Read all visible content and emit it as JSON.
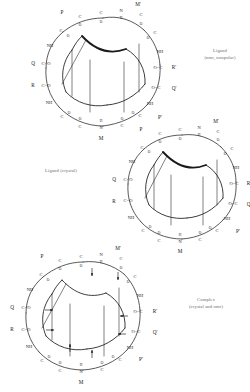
{
  "figure": {
    "background_color": "#ffffff",
    "ink_color": "#1a1a1a",
    "caption_color": "#6b6b6b",
    "width": 250,
    "height": 392
  },
  "captions": {
    "ligand_nmr": {
      "line1": "Ligand",
      "line2": "(nmr, nonpolar)"
    },
    "ligand_crystal": {
      "line1": "Ligand (crystal)",
      "line2": ""
    },
    "complex": {
      "line1": "Complex",
      "line2": "(crystal and nmr)"
    }
  },
  "panels": [
    {
      "id": "panel-a",
      "name": "ligand-nmr-nonpolar",
      "caption_ref": "ligand_nmr",
      "center": {
        "x": 103,
        "y": 75
      },
      "radius": 62,
      "has_arrows": false,
      "residues": [
        "P",
        "M'",
        "R'",
        "Q'",
        "P'",
        "M",
        "NH",
        "Q",
        "R"
      ],
      "ring_atoms": [
        "C",
        "O",
        "N",
        "H",
        "C",
        "O",
        "C",
        "O",
        "NH",
        "O=C",
        "O=C",
        "NH",
        "C=O",
        "C=O",
        "N",
        "H",
        "C",
        "O"
      ],
      "side_labels_left": [
        "P",
        "Q",
        "R",
        "M"
      ],
      "side_labels_right": [
        "M'",
        "R'",
        "Q'",
        "P'"
      ]
    },
    {
      "id": "panel-b",
      "name": "ligand-crystal",
      "caption_ref": "ligand_crystal",
      "center": {
        "x": 182,
        "y": 193
      },
      "radius": 60,
      "has_arrows": false,
      "residues": [
        "P",
        "M'",
        "R'",
        "Q'",
        "P'",
        "M",
        "NH",
        "Q",
        "R"
      ],
      "ring_atoms": [
        "C",
        "O",
        "N",
        "H",
        "C",
        "O",
        "C",
        "O",
        "NH",
        "O=C",
        "O=C",
        "NH",
        "C=O",
        "C=O",
        "N",
        "H",
        "C",
        "O"
      ],
      "side_labels_left": [
        "P",
        "Q",
        "R",
        "M"
      ],
      "side_labels_right": [
        "M'",
        "R'",
        "Q'",
        "P'"
      ]
    },
    {
      "id": "panel-c",
      "name": "complex-crystal-and-nmr",
      "caption_ref": "complex",
      "center": {
        "x": 83,
        "y": 320
      },
      "radius": 62,
      "has_arrows": true,
      "residues": [
        "P",
        "M'",
        "R'",
        "Q'",
        "P'",
        "M",
        "NH",
        "Q",
        "R"
      ],
      "ring_atoms": [
        "C",
        "O",
        "N",
        "H",
        "C",
        "O",
        "C",
        "O",
        "NH",
        "O=C",
        "O=C",
        "NH",
        "C=O",
        "C=O",
        "N",
        "H",
        "C",
        "O"
      ],
      "side_labels_left": [
        "P",
        "Q",
        "R",
        "M"
      ],
      "side_labels_right": [
        "M'",
        "R'",
        "Q'",
        "P'"
      ],
      "arrow_count": 8
    }
  ],
  "atom_glyphs": {
    "carbon": "C",
    "oxygen": "O",
    "nitrogen": "N",
    "hydrogen": "H",
    "amide": "NH",
    "carbonyl_right": "C=O",
    "carbonyl_left": "O=C"
  }
}
